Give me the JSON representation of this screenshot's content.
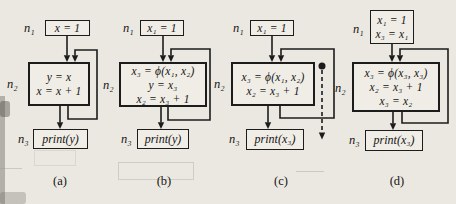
{
  "colors": {
    "ink": "#1c1c1c",
    "paper": "#ebe8e1"
  },
  "figures": [
    {
      "caption": "(a)",
      "n1_label": "n₁",
      "n2_label": "n₂",
      "n3_label": "n₃",
      "n1_lines": [
        "x = 1"
      ],
      "n2_lines": [
        "y = x",
        "x = x + 1"
      ],
      "n3_text": "print(y)"
    },
    {
      "caption": "(b)",
      "n1_label": "n₁",
      "n2_label": "n₂",
      "n3_label": "n₃",
      "n1_lines": [
        "x₁ = 1"
      ],
      "n2_lines": [
        "x₃ = ϕ(x₁, x₂)",
        "y = x₃",
        "x₂ = x₃ + 1"
      ],
      "n3_text": "print(y)"
    },
    {
      "caption": "(c)",
      "n1_label": "n₁",
      "n2_label": "n₂",
      "n3_label": "n₃",
      "n1_lines": [
        "x₁ = 1"
      ],
      "n2_lines": [
        "x₃ = ϕ(x₁, x₂)",
        "x₂ = x₃ + 1"
      ],
      "n3_text": "print(x₃)"
    },
    {
      "caption": "(d)",
      "n1_label": "n₁",
      "n2_label": "n₂",
      "n3_label": "n₃",
      "n1_lines": [
        "x₁ = 1",
        "x₃ = x₁"
      ],
      "n2_lines": [
        "x₃ = ϕ(x₃, x₃)",
        "x₂ = x₃ + 1",
        "x₃ = x₂"
      ],
      "n3_text": "print(x₃)"
    }
  ]
}
